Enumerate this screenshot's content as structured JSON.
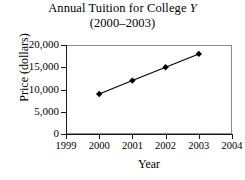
{
  "chart_data": {
    "type": "line",
    "title": "Annual Tuition for College Y",
    "title_main": "Annual Tuition for College ",
    "title_italic": "Y",
    "subtitle": "(2000–2003)",
    "xlabel": "Year",
    "ylabel": "Price (dollars)",
    "x": [
      2000,
      2001,
      2002,
      2003
    ],
    "values": [
      9000,
      12000,
      15000,
      18000
    ],
    "categories": [
      "2000",
      "2001",
      "2002",
      "2003"
    ],
    "xlim": [
      1999,
      2004
    ],
    "ylim": [
      0,
      20000
    ],
    "xticks": [
      "1999",
      "2000",
      "2001",
      "2002",
      "2003",
      "2004"
    ],
    "xtick_values": [
      1999,
      2000,
      2001,
      2002,
      2003,
      2004
    ],
    "yticks": [
      "0",
      "5,000",
      "10,000",
      "15,000",
      "20,000"
    ],
    "ytick_values": [
      0,
      5000,
      10000,
      15000,
      20000
    ],
    "grid": false,
    "legend": false,
    "marker": "diamond",
    "series_color": "#000000",
    "frame_color": "#8d8d8d",
    "axis_color": "#1a1a1a",
    "background": "#ffffff"
  }
}
